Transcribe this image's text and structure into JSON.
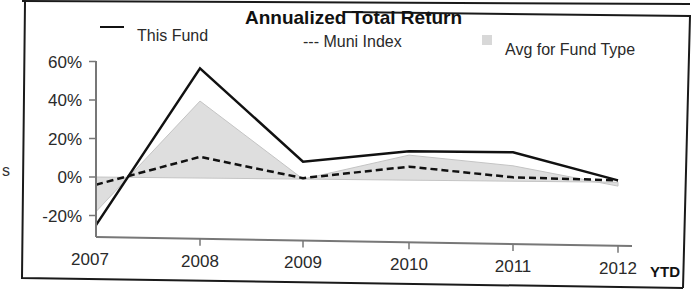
{
  "page": {
    "stray_text": "s",
    "ytd_label": "YTD"
  },
  "chart_data": {
    "type": "line",
    "title": "Annualized Total Return",
    "xlabel": "",
    "ylabel": "",
    "categories": [
      "2007",
      "2008",
      "2009",
      "2010",
      "2011",
      "2012"
    ],
    "x_suffix_label": "YTD",
    "yticks": [
      -20,
      0,
      20,
      40,
      60
    ],
    "ytick_labels": [
      "-20%",
      "0%",
      "20%",
      "40%",
      "60%"
    ],
    "ylim": [
      -30,
      60
    ],
    "grid": false,
    "legend_position": "top",
    "series": [
      {
        "name": "This Fund",
        "style": "solid",
        "values": [
          -25,
          57,
          9,
          15,
          15,
          1
        ]
      },
      {
        "name": "Muni Index",
        "style": "dashed",
        "values": [
          -4,
          11,
          0.5,
          7,
          2,
          1
        ]
      },
      {
        "name": "Avg for Fund Type",
        "style": "area",
        "values": [
          -18,
          40,
          0,
          13,
          8,
          -2
        ]
      }
    ]
  },
  "legend": {
    "fund_label": "This Fund",
    "muni_label": "--- Muni Index",
    "avg_label": "Avg for Fund Type"
  },
  "colors": {
    "fund_line": "#111111",
    "muni_line": "#111111",
    "avg_fill": "#dedede",
    "axis": "#777777",
    "frame": "#1a1a1a"
  }
}
